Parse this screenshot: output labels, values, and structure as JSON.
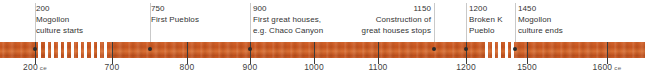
{
  "diagram": {
    "axis": {
      "start_year": 200,
      "end_year": 1600,
      "era_suffix": "ce",
      "ticks": [
        {
          "year": 200,
          "label": "200",
          "era": "ce",
          "x": 35
        },
        {
          "year": 700,
          "label": "700",
          "era": "",
          "x": 112
        },
        {
          "year": 800,
          "label": "800",
          "era": "",
          "x": 187
        },
        {
          "year": 900,
          "label": "900",
          "era": "",
          "x": 250
        },
        {
          "year": 1000,
          "label": "1000",
          "era": "",
          "x": 314
        },
        {
          "year": 1100,
          "label": "1100",
          "era": "",
          "x": 378
        },
        {
          "year": 1200,
          "label": "1200",
          "era": "",
          "x": 466
        },
        {
          "year": 1500,
          "label": "1500",
          "era": "",
          "x": 527
        },
        {
          "year": 1600,
          "label": "1600",
          "era": "ce",
          "x": 607
        }
      ]
    },
    "bar": {
      "color": "#c8551f",
      "hatched_segments": [
        {
          "from_year": 200,
          "to_year": 700,
          "x": 38,
          "width": 72
        },
        {
          "from_year": 1200,
          "to_year": 1450,
          "x": 485,
          "width": 30
        }
      ]
    },
    "events": [
      {
        "year": "200",
        "description": "Mogollon\nculture starts",
        "line1": "Mogollon",
        "line2": "culture starts",
        "line3": "",
        "dot_x": 35,
        "leader_x": 35,
        "leader_height": 39,
        "text_x": 36,
        "align": "left"
      },
      {
        "year": "750",
        "description": "First Pueblos",
        "line1": "First Pueblos",
        "line2": "",
        "line3": "",
        "dot_x": 150,
        "leader_x": 150,
        "leader_height": 39,
        "text_x": 151,
        "align": "left"
      },
      {
        "year": "900",
        "description": "First great houses,\ne.g. Chaco Canyon",
        "line1": "First great houses,",
        "line2": "e.g. Chaco Canyon",
        "line3": "",
        "dot_x": 250,
        "leader_x": 250,
        "leader_height": 39,
        "text_x": 253,
        "align": "left"
      },
      {
        "year": "1150",
        "description": "Construction of\ngreat houses stops",
        "line1": "Construction of",
        "line2": "great houses stops",
        "line3": "",
        "dot_x": 434,
        "leader_x": 434,
        "leader_height": 39,
        "text_x": 431,
        "align": "right"
      },
      {
        "year": "1200",
        "description": "Broken K\nPueblo",
        "line1": "Broken K",
        "line2": "Pueblo",
        "line3": "",
        "dot_x": 466,
        "leader_x": 466,
        "leader_height": 39,
        "text_x": 469,
        "align": "left"
      },
      {
        "year": "1450",
        "description": "Mogollon\nculture ends",
        "line1": "Mogollon",
        "line2": "culture ends",
        "line3": "",
        "dot_x": 515,
        "leader_x": 515,
        "leader_height": 39,
        "text_x": 518,
        "align": "left"
      }
    ]
  }
}
